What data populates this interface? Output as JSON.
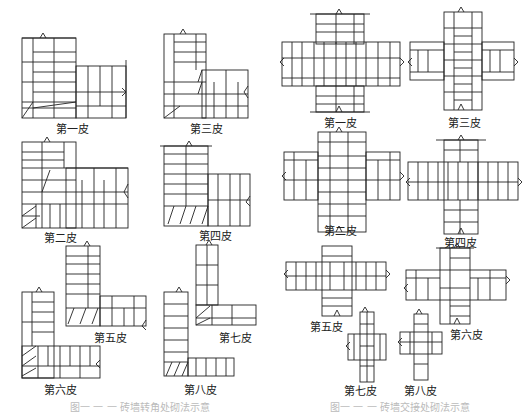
{
  "left_panel": {
    "title": "L-corner brick bonding courses",
    "labels": {
      "course1": "第一皮",
      "course3": "第三皮",
      "course2": "第二皮",
      "course4": "第四皮",
      "course5": "第五皮",
      "course7": "第七皮",
      "course6": "第六皮",
      "course8": "第八皮"
    },
    "caption": "图一 一 一 砖墙转角处砌法示意"
  },
  "right_panel": {
    "title": "Cross-junction brick bonding courses",
    "labels": {
      "course1": "第一皮",
      "course3": "第三皮",
      "course2": "第二皮",
      "course4": "第四皮",
      "course5": "第五皮",
      "course6": "第六皮",
      "course7": "第七皮",
      "course8": "第八皮"
    },
    "caption": "图一 一 一 砖墙交接处砌法示意"
  },
  "colors": {
    "line": "#222222",
    "background": "#ffffff",
    "caption": "#bbbbbb"
  }
}
